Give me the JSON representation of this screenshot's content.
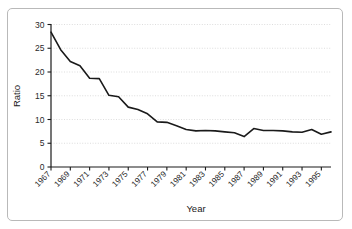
{
  "figure": {
    "border_color": "#b9b9b9",
    "background": "#ffffff"
  },
  "chart_data": {
    "type": "line",
    "title": "",
    "xlabel": "Year",
    "ylabel": "Ratio",
    "xlim": [
      1967,
      1996
    ],
    "ylim": [
      0,
      30
    ],
    "yticks": [
      0,
      5,
      10,
      15,
      20,
      25,
      30
    ],
    "xticks": [
      1967,
      1969,
      1971,
      1973,
      1975,
      1977,
      1979,
      1981,
      1983,
      1985,
      1987,
      1989,
      1991,
      1993,
      1995
    ],
    "xtick_rotation": 45,
    "grid": "horizontal-dotted",
    "legend": "none",
    "line_color": "#1a1a1a",
    "line_width": 1.6,
    "x": [
      1967,
      1968,
      1969,
      1970,
      1971,
      1972,
      1973,
      1974,
      1975,
      1976,
      1977,
      1978,
      1979,
      1980,
      1981,
      1982,
      1983,
      1984,
      1985,
      1986,
      1987,
      1988,
      1989,
      1990,
      1991,
      1992,
      1993,
      1994,
      1995,
      1996
    ],
    "y": [
      28.4,
      24.7,
      22.2,
      21.3,
      18.7,
      18.6,
      15.1,
      14.8,
      12.6,
      12.1,
      11.2,
      9.5,
      9.4,
      8.7,
      7.9,
      7.6,
      7.7,
      7.6,
      7.4,
      7.2,
      6.4,
      8.1,
      7.7,
      7.7,
      7.6,
      7.4,
      7.3,
      7.9,
      6.9,
      7.4
    ],
    "series": [
      {
        "name": "Ratio",
        "values": [
          28.4,
          24.7,
          22.2,
          21.3,
          18.7,
          18.6,
          15.1,
          14.8,
          12.6,
          12.1,
          11.2,
          9.5,
          9.4,
          8.7,
          7.9,
          7.6,
          7.7,
          7.6,
          7.4,
          7.2,
          6.4,
          8.1,
          7.7,
          7.7,
          7.6,
          7.4,
          7.3,
          7.9,
          6.9,
          7.4
        ]
      }
    ]
  },
  "labels": {
    "y_axis_title": "Ratio",
    "x_axis_title": "Year",
    "yticks": [
      "0",
      "5",
      "10",
      "15",
      "20",
      "25",
      "30"
    ],
    "xticks": [
      "1967",
      "1969",
      "1971",
      "1973",
      "1975",
      "1977",
      "1979",
      "1981",
      "1983",
      "1985",
      "1987",
      "1989",
      "1991",
      "1993",
      "1995"
    ]
  }
}
